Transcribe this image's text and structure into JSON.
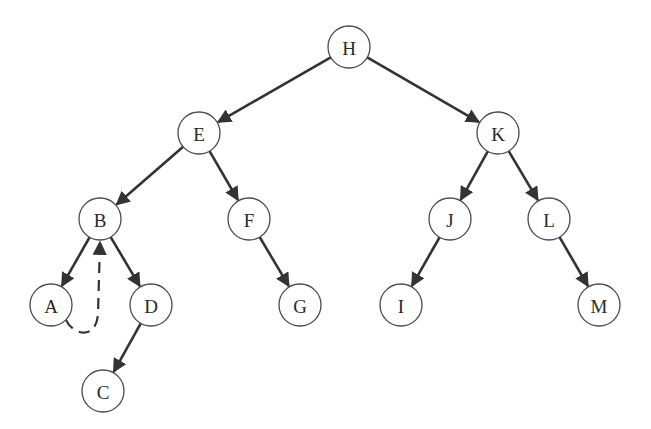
{
  "diagram": {
    "type": "threaded-binary-tree",
    "node_radius": 21,
    "colors": {
      "edge": "#333333",
      "node_stroke": "#4a4a4a",
      "node_fill": "#ffffff",
      "label": "#2a2a2a"
    },
    "nodes": [
      {
        "id": "H",
        "label": "H",
        "x": 349,
        "y": 47
      },
      {
        "id": "E",
        "label": "E",
        "x": 199,
        "y": 133
      },
      {
        "id": "K",
        "label": "K",
        "x": 498,
        "y": 133
      },
      {
        "id": "B",
        "label": "B",
        "x": 100,
        "y": 219
      },
      {
        "id": "F",
        "label": "F",
        "x": 249,
        "y": 219
      },
      {
        "id": "J",
        "label": "J",
        "x": 450,
        "y": 219
      },
      {
        "id": "L",
        "label": "L",
        "x": 549,
        "y": 219
      },
      {
        "id": "A",
        "label": "A",
        "x": 51,
        "y": 305
      },
      {
        "id": "D",
        "label": "D",
        "x": 151,
        "y": 305
      },
      {
        "id": "G",
        "label": "G",
        "x": 300,
        "y": 305
      },
      {
        "id": "I",
        "label": "I",
        "x": 401,
        "y": 305
      },
      {
        "id": "M",
        "label": "M",
        "x": 599,
        "y": 305
      },
      {
        "id": "C",
        "label": "C",
        "x": 103,
        "y": 391
      }
    ],
    "edges": [
      {
        "from": "H",
        "to": "E"
      },
      {
        "from": "H",
        "to": "K"
      },
      {
        "from": "E",
        "to": "B"
      },
      {
        "from": "E",
        "to": "F"
      },
      {
        "from": "K",
        "to": "J"
      },
      {
        "from": "K",
        "to": "L"
      },
      {
        "from": "B",
        "to": "A"
      },
      {
        "from": "B",
        "to": "D"
      },
      {
        "from": "F",
        "to": "G"
      },
      {
        "from": "J",
        "to": "I"
      },
      {
        "from": "L",
        "to": "M"
      },
      {
        "from": "D",
        "to": "C"
      }
    ],
    "threads": [
      {
        "from": "A",
        "to": "B",
        "style": "dashed"
      }
    ]
  }
}
